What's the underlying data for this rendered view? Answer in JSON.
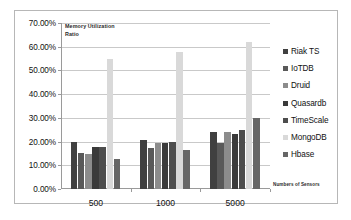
{
  "chart_data": {
    "type": "bar",
    "title": "Memory Utilization Ratio",
    "title_line1": "Memory Utilization",
    "title_line2": "Ratio",
    "xlabel": "Numbers of Sensors",
    "ylabel": "",
    "categories": [
      "500",
      "1000",
      "5000"
    ],
    "ylim": [
      0,
      70
    ],
    "ytick_labels": [
      "0.00%",
      "10.00%",
      "20.00%",
      "30.00%",
      "40.00%",
      "50.00%",
      "60.00%",
      "70.00%"
    ],
    "ytick_values": [
      0,
      10,
      20,
      30,
      40,
      50,
      60,
      70
    ],
    "grid": true,
    "legend_position": "right",
    "series": [
      {
        "name": "Riak TS",
        "color": "#404040",
        "values": [
          19.9,
          20.8,
          24.1
        ]
      },
      {
        "name": "IoTDB",
        "color": "#595959",
        "values": [
          15.2,
          17.1,
          19.5
        ]
      },
      {
        "name": "Druid",
        "color": "#8c8c8c",
        "values": [
          14.6,
          19.6,
          23.9
        ]
      },
      {
        "name": "Quasardb",
        "color": "#3a3a3a",
        "values": [
          17.8,
          19.4,
          23.3
        ]
      },
      {
        "name": "TimeScale",
        "color": "#4d4d4d",
        "values": [
          17.9,
          19.9,
          24.7
        ]
      },
      {
        "name": "MongoDB",
        "color": "#d9d9d9",
        "values": [
          55.0,
          57.6,
          61.9
        ]
      },
      {
        "name": "Hbase",
        "color": "#666666",
        "values": [
          12.6,
          16.5,
          30.1
        ]
      }
    ]
  }
}
